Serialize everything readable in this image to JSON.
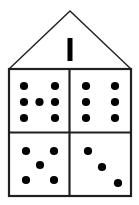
{
  "figure": {
    "name": "house-shaped dot-pattern diagram",
    "background_color": "#ffffff",
    "stroke_color": "#231f20",
    "dot_color": "#000000",
    "width": 139,
    "height": 205
  },
  "house": {
    "roof": {
      "name": "roof-triangle",
      "peak": [
        70,
        11
      ],
      "left_eave": [
        9,
        69
      ],
      "right_eave": [
        131,
        69
      ],
      "stroke_width": 1.4
    },
    "body": {
      "name": "house-body-rectangle",
      "x": 9,
      "y": 69,
      "width": 122,
      "height": 127,
      "stroke_width": 2.2
    },
    "dividers": {
      "vertical_x": 69.5,
      "horizontal_y": 132.5,
      "stroke_width": 2.2
    }
  },
  "attic": {
    "mark": {
      "name": "tally-mark",
      "label": "1",
      "count": 1,
      "x": 67.5,
      "y": 38,
      "width": 5,
      "height": 23,
      "color": "#000000"
    }
  },
  "dot_radius": 4.1,
  "quadrants": [
    {
      "name": "top-left-quadrant",
      "position": "top-left",
      "count": 7,
      "pattern": "two-three-two",
      "dots": [
        [
          24,
          86
        ],
        [
          55,
          86
        ],
        [
          24,
          102
        ],
        [
          39.5,
          102
        ],
        [
          55,
          102
        ],
        [
          24,
          118
        ],
        [
          55,
          118
        ]
      ]
    },
    {
      "name": "top-right-quadrant",
      "position": "top-right",
      "count": 6,
      "pattern": "two-columns-three-rows",
      "dots": [
        [
          86,
          86
        ],
        [
          115,
          86
        ],
        [
          86,
          102
        ],
        [
          115,
          102
        ],
        [
          86,
          118
        ],
        [
          115,
          118
        ]
      ]
    },
    {
      "name": "bottom-left-quadrant",
      "position": "bottom-left",
      "count": 5,
      "pattern": "quincunx",
      "dots": [
        [
          26,
          151
        ],
        [
          54,
          151
        ],
        [
          40,
          165
        ],
        [
          26,
          180
        ],
        [
          54,
          180
        ]
      ]
    },
    {
      "name": "bottom-right-quadrant",
      "position": "bottom-right",
      "count": 3,
      "pattern": "diagonal",
      "dots": [
        [
          88,
          151
        ],
        [
          102,
          167
        ],
        [
          118,
          183
        ]
      ]
    }
  ]
}
